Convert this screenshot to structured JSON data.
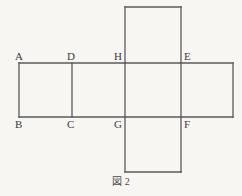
{
  "figure": {
    "caption": "図 2",
    "stroke_color": "#5a5a5a",
    "background_color": "#f7f6f2",
    "label_color": "#3b3b3b",
    "description_type": "cube-net-diagram",
    "vertex_labels": [
      {
        "text": "A",
        "x": 15,
        "y": 51,
        "position": "above-left"
      },
      {
        "text": "D",
        "x": 67,
        "y": 51,
        "position": "above-left"
      },
      {
        "text": "H",
        "x": 114,
        "y": 51,
        "position": "above-left"
      },
      {
        "text": "E",
        "x": 180,
        "y": 51,
        "position": "above-right"
      },
      {
        "text": "B",
        "x": 15,
        "y": 119,
        "position": "below-left"
      },
      {
        "text": "C",
        "x": 67,
        "y": 119,
        "position": "below-left"
      },
      {
        "text": "G",
        "x": 114,
        "y": 119,
        "position": "below-left"
      },
      {
        "text": "F",
        "x": 180,
        "y": 119,
        "position": "below-right"
      }
    ],
    "geometry": {
      "band_top_y": 63,
      "band_bottom_y": 117,
      "band_left_x": 19,
      "band_right_x": 233,
      "vertical_x": [
        19,
        72,
        125,
        181,
        233
      ],
      "top_square": {
        "x1": 125,
        "y1": 7,
        "x2": 181,
        "y2": 63
      },
      "bottom_square": {
        "x1": 125,
        "y1": 117,
        "x2": 181,
        "y2": 172
      }
    },
    "caption_y": 176
  }
}
